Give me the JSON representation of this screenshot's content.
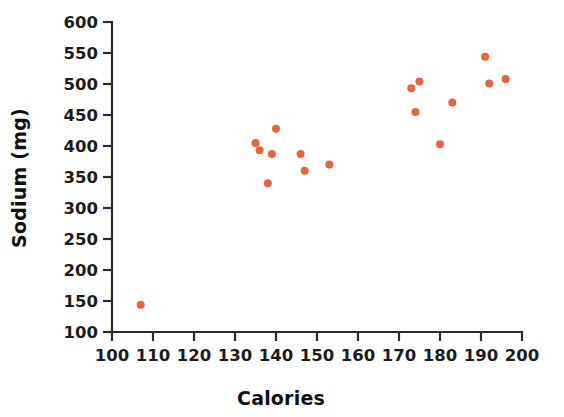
{
  "chart_data": {
    "type": "scatter",
    "title": "",
    "xlabel": "Calories",
    "ylabel": "Sodium (mg)",
    "xlim": [
      100,
      200
    ],
    "ylim": [
      100,
      600
    ],
    "xticks": [
      100,
      110,
      120,
      130,
      140,
      150,
      160,
      170,
      180,
      190,
      200
    ],
    "yticks": [
      100,
      150,
      200,
      250,
      300,
      350,
      400,
      450,
      500,
      550,
      600
    ],
    "grid": false,
    "legend": "none",
    "marker_color": "#e8643c",
    "marker_size": 7,
    "axis_color": "#2b2b2b",
    "background_color": "#ffffff",
    "series": [
      {
        "name": "Hot dogs",
        "color": "#e8643c",
        "points": [
          {
            "x": 107,
            "y": 144
          },
          {
            "x": 135,
            "y": 405
          },
          {
            "x": 136,
            "y": 393
          },
          {
            "x": 138,
            "y": 340
          },
          {
            "x": 139,
            "y": 387
          },
          {
            "x": 140,
            "y": 428
          },
          {
            "x": 146,
            "y": 387
          },
          {
            "x": 147,
            "y": 360
          },
          {
            "x": 153,
            "y": 370
          },
          {
            "x": 173,
            "y": 493
          },
          {
            "x": 174,
            "y": 455
          },
          {
            "x": 175,
            "y": 504
          },
          {
            "x": 180,
            "y": 403
          },
          {
            "x": 183,
            "y": 470
          },
          {
            "x": 191,
            "y": 544
          },
          {
            "x": 192,
            "y": 501
          },
          {
            "x": 196,
            "y": 508
          }
        ]
      }
    ]
  },
  "axes": {
    "x_title": "Calories",
    "y_title": "Sodium (mg)",
    "x_tick_labels": [
      "100",
      "110",
      "120",
      "130",
      "140",
      "150",
      "160",
      "170",
      "180",
      "190",
      "200"
    ],
    "y_tick_labels": [
      "100",
      "150",
      "200",
      "250",
      "300",
      "350",
      "400",
      "450",
      "500",
      "550",
      "600"
    ]
  }
}
